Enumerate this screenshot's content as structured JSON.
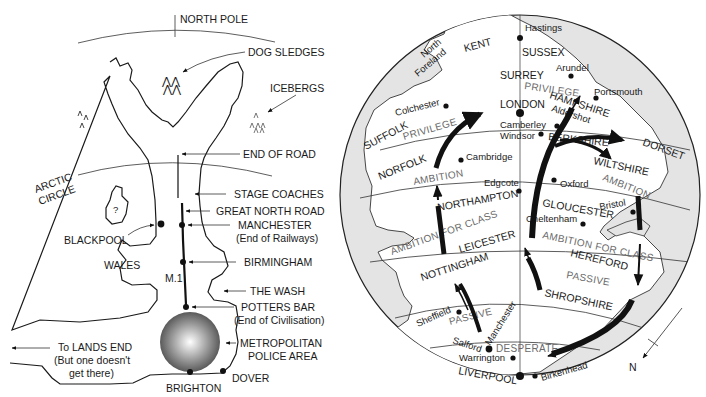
{
  "left_map": {
    "title_hint": "North-centric view of England",
    "labels": {
      "north_pole": "NORTH POLE",
      "dog_sledges": "DOG SLEDGES",
      "icebergs": "ICEBERGS",
      "end_of_road": "END OF ROAD",
      "arctic_circle_1": "ARCTIC",
      "arctic_circle_2": "CIRCLE",
      "stage_coaches": "STAGE COACHES",
      "great_north_road": "GREAT NORTH ROAD",
      "manchester": "MANCHESTER",
      "manchester_note": "(End of Railways)",
      "blackpool": "BLACKPOOL",
      "island_mark": "?",
      "wales": "WALES",
      "birmingham": "BIRMINGHAM",
      "m1": "M.1",
      "the_wash": "THE WASH",
      "potters_bar": "POTTERS BAR",
      "potters_bar_note": "(End of Civilisation)",
      "metropolitan_1": "METROPOLITAN",
      "metropolitan_2": "POLICE AREA",
      "lands_end_1": "To LANDS END",
      "lands_end_2": "(But one doesn't",
      "lands_end_3": "get there)",
      "brighton": "BRIGHTON",
      "dover": "DOVER"
    }
  },
  "right_map": {
    "title_hint": "Globe view of England from the south",
    "places": {
      "hastings": "Hastings",
      "north_foreland_1": "North",
      "north_foreland_2": "Foreland",
      "kent": "KENT",
      "sussex": "SUSSEX",
      "arundel": "Arundel",
      "surrey": "SURREY",
      "portsmouth": "Portsmouth",
      "hampshire": "HAMPSHIRE",
      "aldershot": "Aldershot",
      "colchester": "Colchester",
      "london": "LONDON",
      "camberley": "Camberley",
      "windsor": "Windsor",
      "berkshire": "BERKSHIRE",
      "suffolk": "SUFFOLK",
      "dorset": "DORSET",
      "norfolk": "NORFOLK",
      "cambridge": "Cambridge",
      "wiltshire": "WILTSHIRE",
      "edgcote": "Edgcote",
      "oxford": "Oxford",
      "northampton": "NORTHAMPTON",
      "gloucester": "GLOUCESTER",
      "bristol": "Bristol",
      "cheltenham": "Cheltenham",
      "leicester": "LEICESTER",
      "hereford": "HEREFORD",
      "nottingham": "NOTTINGHAM",
      "shropshire": "SHROPSHIRE",
      "sheffield": "Sheffield",
      "manchester": "Manchester",
      "salford": "Salford",
      "warrington": "Warrington",
      "liverpool": "LIVERPOOL",
      "birkenhead": "Birkenhead",
      "compass_n": "N"
    },
    "zones": {
      "privilege_top": "PRIVILEGE",
      "privilege_left": "PRIVILEGE",
      "ambition_left": "AMBITION",
      "ambition_right": "AMBITION",
      "ambition_class_left": "AMBITION FOR CLASS",
      "ambition_class_right": "AMBITION FOR CLASS",
      "passive_right": "PASSIVE",
      "passive_left": "PASSIVE",
      "desperate": "DESPERATE"
    },
    "colors": {
      "sea": "#e4e4e4",
      "land": "#ffffff",
      "zone_text": "#6a6a6a",
      "ink": "#1a1a1a"
    }
  }
}
